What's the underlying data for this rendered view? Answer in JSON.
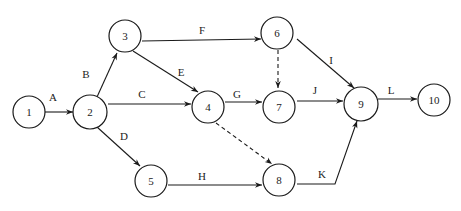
{
  "diagram": {
    "type": "activity-on-arrow network",
    "nodes": [
      {
        "id": "1",
        "label": "1",
        "x": 29,
        "y": 112
      },
      {
        "id": "2",
        "label": "2",
        "x": 90,
        "y": 112
      },
      {
        "id": "3",
        "label": "3",
        "x": 125,
        "y": 36
      },
      {
        "id": "4",
        "label": "4",
        "x": 208,
        "y": 107
      },
      {
        "id": "5",
        "label": "5",
        "x": 151,
        "y": 181
      },
      {
        "id": "6",
        "label": "6",
        "x": 277,
        "y": 33
      },
      {
        "id": "7",
        "label": "7",
        "x": 279,
        "y": 107
      },
      {
        "id": "8",
        "label": "8",
        "x": 279,
        "y": 180
      },
      {
        "id": "9",
        "label": "9",
        "x": 361,
        "y": 104
      },
      {
        "id": "10",
        "label": "10",
        "x": 434,
        "y": 100
      }
    ],
    "edges": [
      {
        "from": "1",
        "to": "2",
        "label": "A",
        "style": "solid"
      },
      {
        "from": "2",
        "to": "3",
        "label": "B",
        "style": "solid"
      },
      {
        "from": "2",
        "to": "4",
        "label": "C",
        "style": "solid"
      },
      {
        "from": "2",
        "to": "5",
        "label": "D",
        "style": "solid"
      },
      {
        "from": "3",
        "to": "4",
        "label": "E",
        "style": "solid"
      },
      {
        "from": "3",
        "to": "6",
        "label": "F",
        "style": "solid"
      },
      {
        "from": "4",
        "to": "7",
        "label": "G",
        "style": "solid"
      },
      {
        "from": "5",
        "to": "8",
        "label": "H",
        "style": "solid"
      },
      {
        "from": "6",
        "to": "9",
        "label": "I",
        "style": "solid"
      },
      {
        "from": "7",
        "to": "9",
        "label": "J",
        "style": "solid"
      },
      {
        "from": "8",
        "to": "9",
        "label": "K",
        "style": "solid"
      },
      {
        "from": "9",
        "to": "10",
        "label": "L",
        "style": "solid"
      },
      {
        "from": "6",
        "to": "7",
        "label": "",
        "style": "dashed"
      },
      {
        "from": "4",
        "to": "8",
        "label": "",
        "style": "dashed"
      }
    ]
  }
}
